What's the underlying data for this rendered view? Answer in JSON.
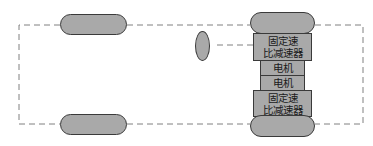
{
  "diagram": {
    "components": {
      "reducer_top": {
        "line1": "固定速",
        "line2": "比减速器"
      },
      "motor_top": {
        "label": "电机"
      },
      "motor_bottom": {
        "label": "电机"
      },
      "reducer_bottom": {
        "line1": "固定速",
        "line2": "比减速器"
      }
    },
    "colors": {
      "fill": "#a9a9a9",
      "stroke": "#3a3a3a",
      "dashed_line": "#808080"
    }
  }
}
